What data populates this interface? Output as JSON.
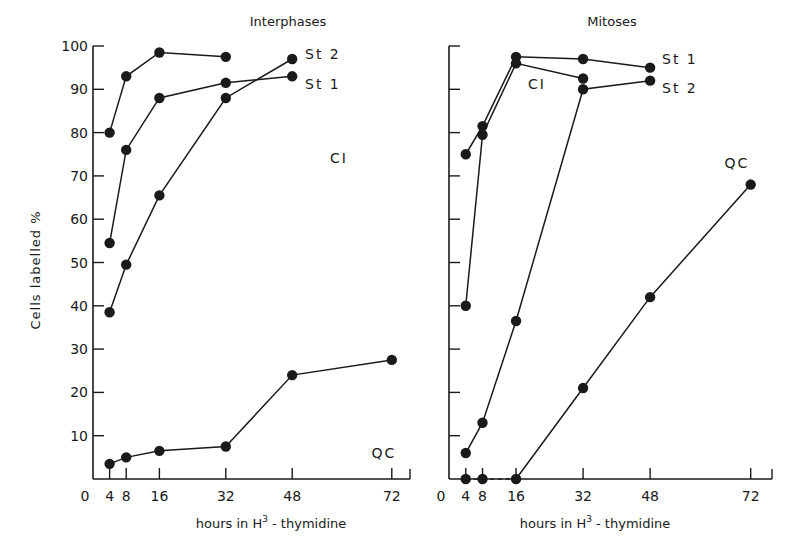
{
  "figure": {
    "ylabel": "Cells labelled %",
    "xlabel_prefix": "hours in H",
    "xlabel_sup": "3",
    "xlabel_suffix": " - thymidine"
  },
  "colors": {
    "ink": "#1a1a1a",
    "background": "#ffffff"
  },
  "chart_data": [
    {
      "type": "line",
      "title": "Interphases",
      "xlabel": "hours in H³-thymidine",
      "ylabel": "Cells labelled %",
      "x_ticks": [
        0,
        4,
        8,
        16,
        32,
        48,
        72
      ],
      "y_ticks": [
        10,
        20,
        30,
        40,
        50,
        60,
        70,
        80,
        90,
        100
      ],
      "xlim": [
        0,
        77
      ],
      "ylim": [
        0,
        100
      ],
      "grid": false,
      "series": [
        {
          "name": "CI",
          "x": [
            4,
            8,
            16,
            32
          ],
          "values": [
            80,
            93,
            98.5,
            97.5
          ],
          "label_at": {
            "x": 32,
            "y": 97.5,
            "side": "right"
          }
        },
        {
          "name": "St 1",
          "x": [
            4,
            8,
            16,
            32,
            48
          ],
          "values": [
            54.5,
            76,
            88,
            91.5,
            93
          ],
          "label_at": {
            "x": 48,
            "y": 93,
            "side": "right"
          }
        },
        {
          "name": "St 2",
          "x": [
            4,
            8,
            16,
            32,
            48
          ],
          "values": [
            38.5,
            49.5,
            65.5,
            88,
            97
          ],
          "label_at": {
            "x": 48,
            "y": 97,
            "side": "right"
          }
        },
        {
          "name": "QC",
          "x": [
            4,
            8,
            16,
            32,
            48,
            72
          ],
          "values": [
            3.5,
            5,
            6.5,
            7.5,
            24,
            27.5
          ],
          "label_at": {
            "x": 72,
            "y": 27.5,
            "side": "below"
          }
        }
      ]
    },
    {
      "type": "line",
      "title": "Mitoses",
      "xlabel": "hours in H³-thymidine",
      "ylabel": "Cells labelled %",
      "x_ticks": [
        0,
        4,
        8,
        16,
        32,
        48,
        72
      ],
      "y_ticks": [
        10,
        20,
        30,
        40,
        50,
        60,
        70,
        80,
        90,
        100
      ],
      "xlim": [
        0,
        77
      ],
      "ylim": [
        0,
        100
      ],
      "grid": false,
      "series": [
        {
          "name": "St 1",
          "x": [
            4,
            8,
            16,
            32,
            48
          ],
          "values": [
            75,
            81.5,
            97.5,
            97,
            95
          ]
        },
        {
          "name": "CI",
          "x": [
            4,
            8,
            16,
            32
          ],
          "values": [
            40,
            79.5,
            96,
            92.5
          ]
        },
        {
          "name": "St 2",
          "x": [
            4,
            8,
            16,
            32,
            48
          ],
          "values": [
            6,
            13,
            36.5,
            90,
            92
          ]
        },
        {
          "name": "QC",
          "x": [
            4,
            8,
            16,
            32,
            48,
            72
          ],
          "values": [
            0,
            0,
            0,
            21,
            42,
            68
          ]
        }
      ],
      "annotations": [
        {
          "text": "St 1",
          "near": "48h, 95%"
        },
        {
          "text": "St 2",
          "near": "48h, 92%"
        },
        {
          "text": "CI",
          "near": "24h, 91%"
        },
        {
          "text": "QC",
          "near": "72h, 75%"
        }
      ]
    }
  ]
}
